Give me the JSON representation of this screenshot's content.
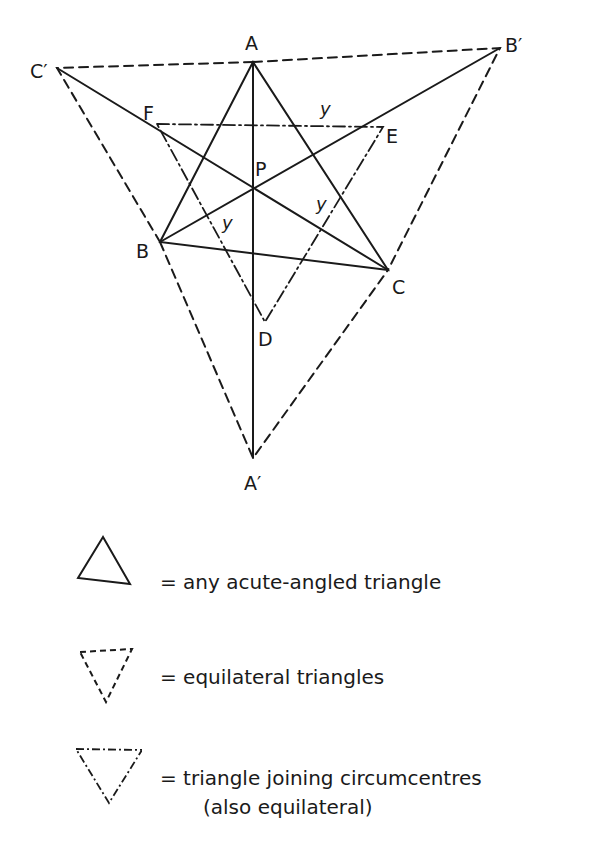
{
  "diagram": {
    "labels": {
      "A": "A",
      "B": "B",
      "C": "C",
      "P": "P",
      "D": "D",
      "E": "E",
      "F": "F",
      "A_prime": "A′",
      "B_prime": "B′",
      "C_prime": "C′",
      "y1": "y",
      "y2": "y",
      "y3": "y"
    },
    "points": {
      "A": [
        253,
        62
      ],
      "B": [
        160,
        242
      ],
      "C": [
        388,
        270
      ],
      "P": [
        253,
        188
      ],
      "D": [
        265,
        322
      ],
      "E": [
        383,
        127
      ],
      "F": [
        157,
        124
      ],
      "A_prime": [
        253,
        458
      ],
      "B_prime": [
        500,
        48
      ],
      "C_prime": [
        57,
        68
      ]
    },
    "line_styles": {
      "acute_triangle": "solid",
      "equilateral_triangles": "dashed",
      "circumcentre_triangle": "dash-dot"
    },
    "stroke_color": "#1a1a1a"
  },
  "legend": {
    "items": [
      {
        "symbol": "solid-triangle",
        "text": "= any acute-angled triangle"
      },
      {
        "symbol": "dashed-triangle",
        "text": "= equilateral triangles"
      },
      {
        "symbol": "dashdot-triangle",
        "text": "= triangle joining circumcentres",
        "text2": "(also equilateral)"
      }
    ]
  }
}
